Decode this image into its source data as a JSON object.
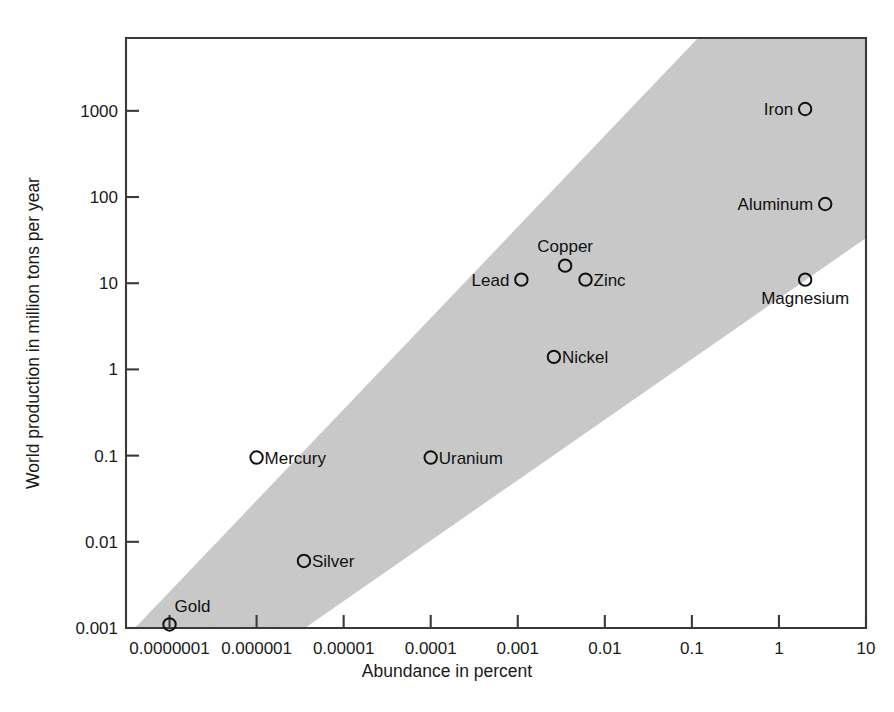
{
  "chart_data": {
    "type": "scatter",
    "title": "",
    "xlabel": "Abundance in percent",
    "ylabel": "World production in million tons per year",
    "xscale": "log",
    "yscale": "log",
    "xlim": [
      3.162e-08,
      10
    ],
    "ylim": [
      0.001,
      7000
    ],
    "grid": false,
    "legend": null,
    "xticks": [
      {
        "value": 1e-07,
        "label": "0.0000001"
      },
      {
        "value": 1e-06,
        "label": "0.000001"
      },
      {
        "value": 1e-05,
        "label": "0.00001"
      },
      {
        "value": 0.0001,
        "label": "0.0001"
      },
      {
        "value": 0.001,
        "label": "0.001"
      },
      {
        "value": 0.01,
        "label": "0.01"
      },
      {
        "value": 0.1,
        "label": "0.1"
      },
      {
        "value": 1,
        "label": "1"
      },
      {
        "value": 10,
        "label": "10"
      }
    ],
    "yticks": [
      {
        "value": 1000,
        "label": "1000"
      },
      {
        "value": 100,
        "label": "100"
      },
      {
        "value": 10,
        "label": "10"
      },
      {
        "value": 1,
        "label": "1"
      },
      {
        "value": 0.1,
        "label": "0.1"
      },
      {
        "value": 0.01,
        "label": "0.01"
      },
      {
        "value": 0.001,
        "label": "0.001"
      }
    ],
    "points": [
      {
        "name": "Gold",
        "x": 1e-07,
        "y": 0.0011,
        "label_pos": "above-right"
      },
      {
        "name": "Silver",
        "x": 3.5e-06,
        "y": 0.006,
        "label_pos": "right"
      },
      {
        "name": "Mercury",
        "x": 1e-06,
        "y": 0.095,
        "label_pos": "right"
      },
      {
        "name": "Uranium",
        "x": 0.0001,
        "y": 0.095,
        "label_pos": "right"
      },
      {
        "name": "Nickel",
        "x": 0.0026,
        "y": 1.4,
        "label_pos": "right"
      },
      {
        "name": "Lead",
        "x": 0.0011,
        "y": 11,
        "label_pos": "left"
      },
      {
        "name": "Copper",
        "x": 0.0035,
        "y": 16,
        "label_pos": "above"
      },
      {
        "name": "Zinc",
        "x": 0.006,
        "y": 11,
        "label_pos": "right"
      },
      {
        "name": "Magnesium",
        "x": 2.0,
        "y": 11,
        "label_pos": "below"
      },
      {
        "name": "Aluminum",
        "x": 3.4,
        "y": 83,
        "label_pos": "left"
      },
      {
        "name": "Iron",
        "x": 2.0,
        "y": 1050,
        "label_pos": "left"
      }
    ],
    "band": {
      "description": "shaded diagonal correlation band",
      "color": "#c9c9c9"
    },
    "annotations": []
  },
  "colors": {
    "axis": "#3a3a3a",
    "marker_stroke": "#111111",
    "band_fill": "#c9c9c9",
    "background": "#ffffff"
  }
}
